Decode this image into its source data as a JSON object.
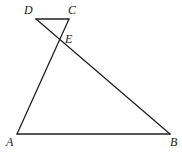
{
  "diagram": {
    "type": "geometry",
    "points": {
      "D": {
        "label": "D",
        "x": 36,
        "y": 19
      },
      "C": {
        "label": "C",
        "x": 69,
        "y": 19
      },
      "E": {
        "label": "E",
        "x": 60,
        "y": 40
      },
      "A": {
        "label": "A",
        "x": 17,
        "y": 134
      },
      "B": {
        "label": "B",
        "x": 170,
        "y": 134
      }
    },
    "segments": [
      [
        "D",
        "C"
      ],
      [
        "C",
        "A"
      ],
      [
        "D",
        "B"
      ],
      [
        "A",
        "B"
      ]
    ],
    "labels": {
      "D": "D",
      "C": "C",
      "E": "E",
      "A": "A",
      "B": "B"
    }
  }
}
